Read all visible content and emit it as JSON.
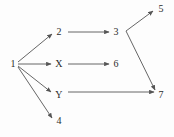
{
  "diagram": {
    "type": "directed-graph",
    "background_color": "#fdfdfd",
    "edge_color": "#555555",
    "label_color": "#2b2b2b",
    "nodes": [
      {
        "id": "1",
        "label": "1",
        "x": 13,
        "y": 64
      },
      {
        "id": "2",
        "label": "2",
        "x": 59,
        "y": 32
      },
      {
        "id": "X",
        "label": "X",
        "x": 59,
        "y": 64
      },
      {
        "id": "Y",
        "label": "Y",
        "x": 59,
        "y": 95
      },
      {
        "id": "4",
        "label": "4",
        "x": 59,
        "y": 121
      },
      {
        "id": "3",
        "label": "3",
        "x": 116,
        "y": 32
      },
      {
        "id": "6",
        "label": "6",
        "x": 116,
        "y": 64
      },
      {
        "id": "5",
        "label": "5",
        "x": 161,
        "y": 9
      },
      {
        "id": "7",
        "label": "7",
        "x": 161,
        "y": 95
      }
    ],
    "edges": [
      {
        "from": "1",
        "to": "2",
        "path": "M 18,62 L 52,34"
      },
      {
        "from": "1",
        "to": "X",
        "path": "M 18,64 L 51,64"
      },
      {
        "from": "1",
        "to": "Y",
        "path": "M 18,66 L 51,92"
      },
      {
        "from": "1",
        "to": "4",
        "path": "M 18,67 L 52,118"
      },
      {
        "from": "2",
        "to": "3",
        "path": "M 68,32 L 109,32"
      },
      {
        "from": "X",
        "to": "6",
        "path": "M 68,64 L 109,64"
      },
      {
        "from": "Y",
        "to": "7",
        "path": "M 68,92 L 154,92"
      },
      {
        "from": "3",
        "to": "5",
        "path": "M 126,31 L 153,11"
      },
      {
        "from": "3",
        "to": "7",
        "path": "M 126,31 L 155,90"
      }
    ]
  }
}
